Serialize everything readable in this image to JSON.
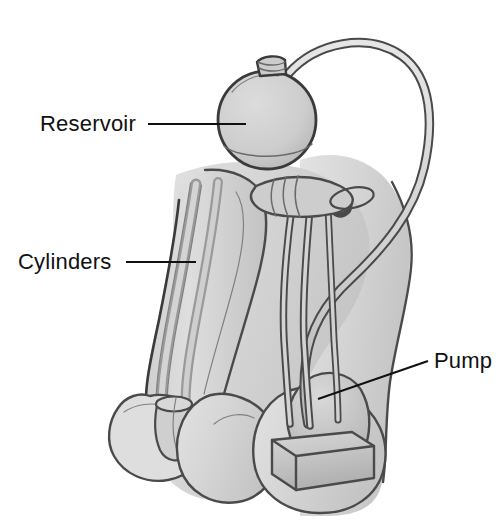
{
  "figure": {
    "background_color": "#ffffff",
    "line_color": "#4a4a4a",
    "label_color": "#111111",
    "body_fill": "#d9d9d9",
    "shadow_fill": "#b5b5b5",
    "device_fill": "#c9c9c9"
  },
  "labels": [
    {
      "id": "reservoir",
      "text": "Reservoir",
      "text_x": 40,
      "text_y": 131,
      "leader_x1": 148,
      "leader_y1": 124,
      "leader_x2": 246,
      "leader_y2": 124
    },
    {
      "id": "cylinders",
      "text": "Cylinders",
      "text_x": 18,
      "text_y": 269,
      "leader_x1": 126,
      "leader_y1": 262,
      "leader_x2": 196,
      "leader_y2": 262
    },
    {
      "id": "pump",
      "text": "Pump",
      "text_x": 434,
      "text_y": 368,
      "leader_x1": 428,
      "leader_y1": 361,
      "leader_x2": 318,
      "leader_y2": 399
    }
  ],
  "components": [
    {
      "id": "reservoir-balloon",
      "name": "reservoir",
      "shape": "sphere",
      "cx": 267,
      "cy": 120,
      "r": 48
    },
    {
      "id": "reservoir-neck",
      "name": "reservoir-neck",
      "shape": "collar"
    },
    {
      "id": "cylinder-left",
      "name": "implant-cylinder",
      "shape": "tube"
    },
    {
      "id": "cylinder-right",
      "name": "implant-cylinder",
      "shape": "tube"
    },
    {
      "id": "pump-bulb",
      "name": "pump-bulb",
      "shape": "dome"
    },
    {
      "id": "pump-base",
      "name": "pump-base",
      "shape": "box"
    },
    {
      "id": "tubing-arc",
      "name": "reservoir-tubing",
      "shape": "arc"
    },
    {
      "id": "tubing-pump",
      "name": "pump-tubing",
      "shape": "lines"
    }
  ],
  "anatomy": [
    {
      "id": "penile-shaft",
      "name": "penile-shaft"
    },
    {
      "id": "glans",
      "name": "glans"
    },
    {
      "id": "scrotum-left",
      "name": "scrotum-left-lobe"
    },
    {
      "id": "scrotum-right",
      "name": "scrotum-right-lobe"
    },
    {
      "id": "abdominal-wall",
      "name": "abdominal-wall"
    }
  ]
}
